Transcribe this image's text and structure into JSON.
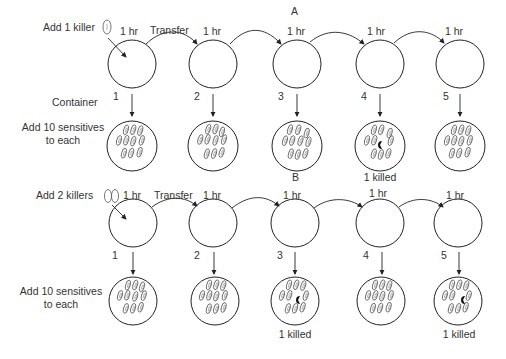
{
  "panels": [
    {
      "id": "A",
      "panel_label": "A",
      "add_killer_label": "Add 1 killer",
      "transfer_label": "Transfer",
      "container_label": "Container",
      "add_sensitives_label_line1": "Add 10 sensitives",
      "add_sensitives_label_line2": "to each",
      "killers_added": 1,
      "steps": [
        {
          "number": "1",
          "time": "1 hr",
          "result": ""
        },
        {
          "number": "2",
          "time": "1 hr",
          "result": ""
        },
        {
          "number": "3",
          "time": "1 hr",
          "result": ""
        },
        {
          "number": "4",
          "time": "1 hr",
          "result": "1 killed"
        },
        {
          "number": "5",
          "time": "1 hr",
          "result": ""
        }
      ]
    },
    {
      "id": "B",
      "panel_label": "B",
      "add_killer_label": "Add 2 killers",
      "transfer_label": "Transfer",
      "add_sensitives_label_line1": "Add 10 sensitives",
      "add_sensitives_label_line2": "to each",
      "killers_added": 2,
      "steps": [
        {
          "number": "1",
          "time": "1 hr",
          "result": ""
        },
        {
          "number": "2",
          "time": "1 hr",
          "result": ""
        },
        {
          "number": "3",
          "time": "1 hr",
          "result": "1 killed"
        },
        {
          "number": "4",
          "time": "1 hr",
          "result": ""
        },
        {
          "number": "5",
          "time": "1 hr",
          "result": "1 killed"
        }
      ]
    }
  ]
}
